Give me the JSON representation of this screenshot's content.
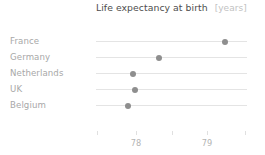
{
  "chart_data": {
    "type": "scatter",
    "title": "Life expectancy at birth",
    "unit_label": "[years]",
    "xlabel": "",
    "ylabel": "",
    "orientation": "horizontal",
    "categories": [
      "France",
      "Germany",
      "Netherlands",
      "UK",
      "Belgium"
    ],
    "values": [
      79.25,
      78.32,
      77.97,
      77.99,
      77.9
    ],
    "xlim": [
      77.45,
      79.55
    ],
    "xticks": [
      77.45,
      78,
      78.5,
      79,
      79.53
    ],
    "xtick_labels": [
      "",
      "78",
      "",
      "79",
      ""
    ],
    "grid": false,
    "legend": false,
    "series": [
      {
        "name": "Life expectancy at birth",
        "points": [
          {
            "category": "France",
            "value": 79.25
          },
          {
            "category": "Germany",
            "value": 78.32
          },
          {
            "category": "Netherlands",
            "value": 77.97
          },
          {
            "category": "UK",
            "value": 77.99
          },
          {
            "category": "Belgium",
            "value": 77.9
          }
        ]
      }
    ],
    "colors": {
      "dot": "#8e8e8e",
      "connector_line": "#e4e4e4",
      "title": "#4d4d4d",
      "unit": "#c2c2c2",
      "category_label": "#a8a8a8",
      "tick_label": "#b4b4b4",
      "background": "#ffffff"
    },
    "geometry": {
      "plot_left_px": 96,
      "plot_right_px": 247,
      "row_top_px": [
        33,
        49,
        65,
        81,
        97
      ],
      "tick_px": [
        97,
        136,
        172,
        207,
        245
      ],
      "value_to_px": {
        "78": 136,
        "79": 207
      }
    }
  }
}
